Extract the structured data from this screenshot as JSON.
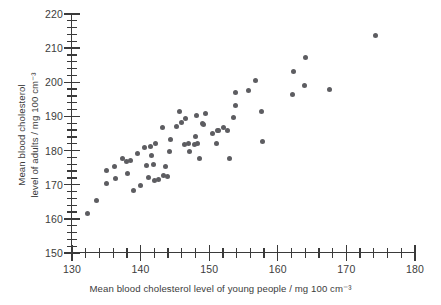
{
  "chart_data": {
    "type": "scatter",
    "title": "",
    "xlabel": "Mean blood cholesterol level of young people / mg 100 cm⁻³",
    "ylabel_line1": "Mean blood cholesterol",
    "ylabel_line2": "level of adults / mg 100 cm⁻³",
    "xlim": [
      130,
      180
    ],
    "ylim": [
      150,
      220
    ],
    "x_major_ticks": [
      130,
      140,
      150,
      160,
      170,
      180
    ],
    "x_major_tick_labels": [
      "130",
      "140",
      "150",
      "160",
      "170",
      "180"
    ],
    "x_minor_tick_interval": 2,
    "y_major_ticks": [
      150,
      160,
      170,
      180,
      190,
      200,
      210,
      220
    ],
    "y_major_tick_labels": [
      "150",
      "160",
      "170",
      "180",
      "190",
      "200",
      "210",
      "220"
    ],
    "y_minor_tick_interval": 2,
    "grid": false,
    "legend": false,
    "marker_color": "#5d5d61",
    "marker_size_px": 5,
    "series": [
      {
        "name": "Blood cholesterol: young people vs adults",
        "points": [
          [
            132.2,
            161.6
          ],
          [
            133.6,
            165.4
          ],
          [
            135.0,
            170.4
          ],
          [
            135.1,
            174.1
          ],
          [
            136.2,
            175.3
          ],
          [
            136.3,
            171.9
          ],
          [
            137.3,
            177.6
          ],
          [
            138.0,
            176.7
          ],
          [
            138.1,
            173.2
          ],
          [
            138.6,
            177.0
          ],
          [
            139.0,
            168.4
          ],
          [
            139.6,
            179.2
          ],
          [
            140.0,
            169.8
          ],
          [
            140.5,
            181.0
          ],
          [
            140.9,
            175.7
          ],
          [
            141.1,
            172.0
          ],
          [
            141.4,
            181.1
          ],
          [
            141.6,
            178.5
          ],
          [
            141.9,
            175.9
          ],
          [
            142.0,
            171.2
          ],
          [
            142.1,
            182.0
          ],
          [
            142.6,
            171.4
          ],
          [
            143.2,
            186.9
          ],
          [
            143.4,
            172.6
          ],
          [
            143.6,
            175.2
          ],
          [
            143.9,
            172.4
          ],
          [
            144.2,
            179.7
          ],
          [
            144.3,
            183.2
          ],
          [
            145.3,
            187.0
          ],
          [
            145.6,
            191.5
          ],
          [
            145.9,
            188.1
          ],
          [
            146.4,
            181.9
          ],
          [
            146.6,
            189.3
          ],
          [
            147.0,
            182.0
          ],
          [
            147.2,
            179.8
          ],
          [
            147.8,
            181.9
          ],
          [
            148.0,
            184.0
          ],
          [
            148.1,
            190.2
          ],
          [
            148.3,
            182.2
          ],
          [
            148.6,
            177.8
          ],
          [
            149.0,
            187.8
          ],
          [
            149.2,
            187.6
          ],
          [
            149.4,
            190.8
          ],
          [
            150.5,
            185.1
          ],
          [
            151.0,
            182.0
          ],
          [
            151.2,
            185.9
          ],
          [
            151.4,
            186.0
          ],
          [
            152.1,
            186.8
          ],
          [
            152.6,
            185.9
          ],
          [
            152.9,
            177.7
          ],
          [
            153.6,
            189.7
          ],
          [
            153.8,
            193.1
          ],
          [
            153.9,
            196.9
          ],
          [
            155.8,
            197.5
          ],
          [
            156.7,
            200.5
          ],
          [
            157.6,
            191.3
          ],
          [
            157.8,
            182.6
          ],
          [
            162.1,
            196.4
          ],
          [
            162.3,
            203.2
          ],
          [
            163.9,
            199.1
          ],
          [
            164.1,
            207.4
          ],
          [
            167.6,
            197.8
          ],
          [
            174.2,
            213.6
          ]
        ]
      }
    ]
  }
}
